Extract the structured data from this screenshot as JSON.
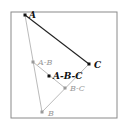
{
  "diagram": {
    "frame": {
      "x": 11,
      "y": 12,
      "w": 106,
      "h": 106,
      "stroke": "#8a8a8a"
    },
    "points": [
      {
        "id": "A",
        "label": "A",
        "x": 25,
        "y": 15,
        "color": "#111111",
        "label_dx": 4,
        "label_dy": 3
      },
      {
        "id": "C",
        "label": "C",
        "x": 89,
        "y": 64,
        "color": "#111111",
        "label_dx": 5,
        "label_dy": 4
      },
      {
        "id": "B",
        "label": "B",
        "x": 42,
        "y": 112,
        "color": "#9a9a9a",
        "label_dx": 6,
        "label_dy": 4
      },
      {
        "id": "AB",
        "label": "A-B",
        "x": 33,
        "y": 62,
        "color": "#9a9a9a",
        "label_dx": 5,
        "label_dy": 3
      },
      {
        "id": "ABC",
        "label": "A-B-C",
        "x": 49,
        "y": 76,
        "color": "#111111",
        "label_dx": 4,
        "label_dy": 3
      },
      {
        "id": "BC",
        "label": "B-C",
        "x": 65,
        "y": 88,
        "color": "#9a9a9a",
        "label_dx": 5,
        "label_dy": 3
      }
    ],
    "edges": [
      {
        "from": "A",
        "to": "C",
        "color": "#222222",
        "width": 1.1
      },
      {
        "from": "A",
        "to": "B",
        "color": "#a8a8a8",
        "width": 0.8
      },
      {
        "from": "B",
        "to": "C",
        "color": "#a8a8a8",
        "width": 0.8
      },
      {
        "from": "AB",
        "to": "BC",
        "color": "#a8a8a8",
        "width": 0.8
      }
    ]
  }
}
